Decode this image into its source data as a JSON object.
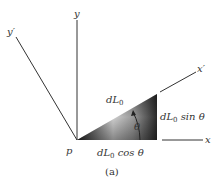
{
  "figure": {
    "caption": "(a)",
    "point_label": "p",
    "axes": {
      "y": "y",
      "y_prime": "y′",
      "x": "x",
      "x_prime": "x′"
    },
    "triangle": {
      "hypotenuse_label_main": "dL",
      "hypotenuse_label_sub": "0",
      "angle_label": "θ",
      "vertical_side_label_main": "dL",
      "vertical_side_label_sub": "0",
      "vertical_side_label_tail": " sin θ",
      "horizontal_side_label_main": "dL",
      "horizontal_side_label_sub": "0",
      "horizontal_side_label_tail": " cos θ"
    },
    "colors": {
      "line": "#333333",
      "shade_dark": "#2a2a2a",
      "shade_light": "#e8e8e8"
    }
  }
}
